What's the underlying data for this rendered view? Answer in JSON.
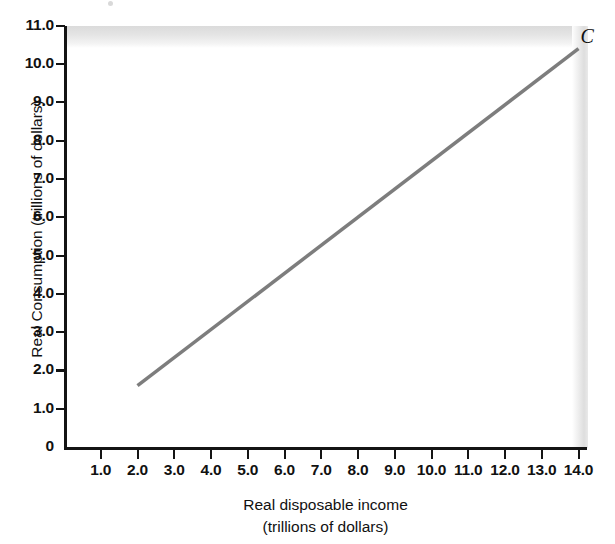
{
  "chart_data": {
    "type": "line",
    "title": "",
    "subtitle": "",
    "xlabel": "Real disposable income",
    "xlabel_units": "(trillions of dollars)",
    "ylabel": "Real Consumption (trillions of dollars)",
    "xlim": [
      0,
      14.5
    ],
    "ylim": [
      0,
      11
    ],
    "grid": false,
    "legend_position": "inline-endpoint",
    "x_ticks": [
      1.0,
      2.0,
      3.0,
      4.0,
      5.0,
      6.0,
      7.0,
      8.0,
      9.0,
      10.0,
      11.0,
      12.0,
      13.0,
      14.0
    ],
    "x_tick_labels": [
      "1.0",
      "2.0",
      "3.0",
      "4.0",
      "5.0",
      "6.0",
      "7.0",
      "8.0",
      "9.0",
      "10.0",
      "11.0",
      "12.0",
      "13.0",
      "14.0"
    ],
    "y_ticks": [
      0,
      1.0,
      2.0,
      3.0,
      4.0,
      5.0,
      6.0,
      7.0,
      8.0,
      9.0,
      10.0,
      11.0
    ],
    "y_tick_labels": [
      "0",
      "1.0",
      "2.0",
      "3.0",
      "4.0",
      "5.0",
      "6.0",
      "7.0",
      "8.0",
      "9.0",
      "10.0",
      "11.0"
    ],
    "series": [
      {
        "name": "C",
        "label": "C",
        "color": "#7d7d7d",
        "linewidth": 3.5,
        "x": [
          2.0,
          14.0
        ],
        "values": [
          1.6,
          10.4
        ],
        "annotation": "C",
        "annotation_x": 14.0,
        "annotation_y": 10.7
      }
    ],
    "axis_color": "#141414",
    "background": "#ffffff"
  },
  "figure": {
    "series_label": "C",
    "xlabel_line1": "Real disposable income",
    "xlabel_line2": "(trillions of dollars)",
    "ylabel_text": "Real Consumption (trillions of dollars)"
  }
}
